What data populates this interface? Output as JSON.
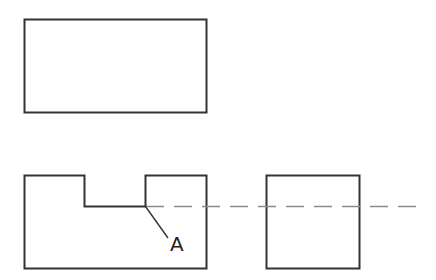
{
  "diagram": {
    "title": "",
    "colors": {
      "outline": "#333333",
      "hidden_line": "#8a8a8a",
      "label": "#222222",
      "background": "#ffffff"
    },
    "views": [
      {
        "name": "top-view",
        "shape": "rectangle",
        "x": 24,
        "y": 19,
        "width": 182,
        "height": 93
      },
      {
        "name": "front-view",
        "shape": "notched-rectangle",
        "points": [
          [
            24,
            175
          ],
          [
            84,
            175
          ],
          [
            84,
            206
          ],
          [
            145,
            206
          ],
          [
            145,
            175
          ],
          [
            206,
            175
          ],
          [
            206,
            268
          ],
          [
            24,
            268
          ]
        ]
      },
      {
        "name": "side-view",
        "shape": "square",
        "x": 266,
        "y": 175,
        "width": 93,
        "height": 93
      }
    ],
    "projection_line": {
      "x1": 146,
      "y1": 206,
      "x2": 423,
      "y2": 206,
      "style": "dashed",
      "dash": [
        18,
        10
      ]
    },
    "leader_line": {
      "x1": 145,
      "y1": 206,
      "x2": 168,
      "y2": 238
    },
    "labels": [
      {
        "text": "A",
        "x": 171,
        "y": 251
      }
    ]
  }
}
